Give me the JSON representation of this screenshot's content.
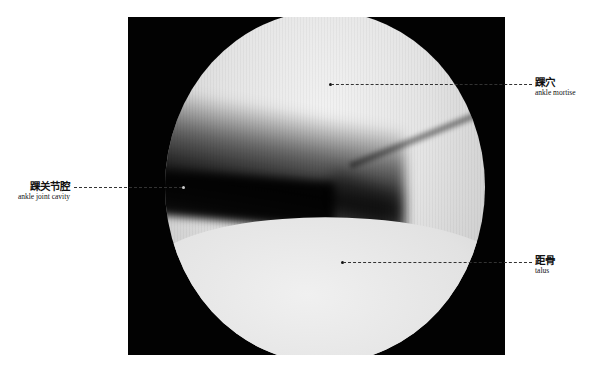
{
  "image": {
    "description": "arthroscopic view of ankle joint",
    "frame_color": "#020202",
    "background": "#ffffff"
  },
  "labels": [
    {
      "id": "ankle-mortise",
      "zh": "踝穴",
      "en": "ankle mortise",
      "side": "right"
    },
    {
      "id": "ankle-joint-cavity",
      "zh": "踝关节腔",
      "en": "ankle joint cavity",
      "side": "left"
    },
    {
      "id": "talus",
      "zh": "距骨",
      "en": "talus",
      "side": "right"
    }
  ]
}
